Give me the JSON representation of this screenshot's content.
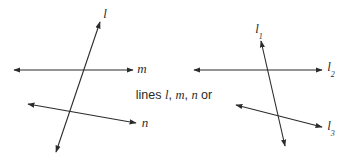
{
  "figure": {
    "width": 348,
    "height": 163,
    "background_color": "#ffffff",
    "stroke_color": "#2b2b2b",
    "text_color": "#2b2b2b",
    "stroke_width": 1.1
  },
  "caption": {
    "lead_text": "lines ",
    "var_1": "l",
    "sep_1": ", ",
    "var_2": "m",
    "sep_2": ", ",
    "var_3": "n",
    "trail_text": " or"
  },
  "left_diagram": {
    "name": "three-lines-lowercase-labels",
    "lines": [
      {
        "id": "line-l",
        "label": "l",
        "subscript": "",
        "x1": 56,
        "y1": 152,
        "x2": 100,
        "y2": 22,
        "arrow_start": true,
        "arrow_end": true,
        "label_x": 105,
        "label_y": 13
      },
      {
        "id": "line-m",
        "label": "m",
        "subscript": "",
        "x1": 14,
        "y1": 70,
        "x2": 133,
        "y2": 70,
        "arrow_start": true,
        "arrow_end": true,
        "label_x": 142,
        "label_y": 68
      },
      {
        "id": "line-n",
        "label": "n",
        "subscript": "",
        "x1": 28,
        "y1": 104,
        "x2": 136,
        "y2": 123,
        "arrow_start": true,
        "arrow_end": true,
        "label_x": 145,
        "label_y": 122
      }
    ]
  },
  "right_diagram": {
    "name": "three-lines-subscript-labels",
    "lines": [
      {
        "id": "line-l1",
        "label": "l",
        "subscript": "1",
        "x1": 285,
        "y1": 146,
        "x2": 261,
        "y2": 41,
        "arrow_start": true,
        "arrow_end": true,
        "label_x": 259,
        "label_y": 30
      },
      {
        "id": "line-l2",
        "label": "l",
        "subscript": "2",
        "x1": 194,
        "y1": 70,
        "x2": 322,
        "y2": 70,
        "arrow_start": true,
        "arrow_end": true,
        "label_x": 331,
        "label_y": 68
      },
      {
        "id": "line-l3",
        "label": "l",
        "subscript": "3",
        "x1": 236,
        "y1": 105,
        "x2": 322,
        "y2": 127,
        "arrow_start": true,
        "arrow_end": true,
        "label_x": 331,
        "label_y": 127
      }
    ]
  }
}
